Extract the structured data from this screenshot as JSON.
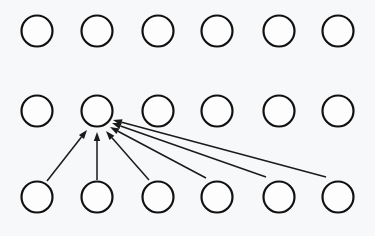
{
  "diagram": {
    "type": "node-graph",
    "canvas": {
      "width": 375,
      "height": 236
    },
    "colors": {
      "background": "#f7f8f9",
      "node_fill": "#fdfdfd",
      "node_stroke": "#111111",
      "edge_stroke": "#1a1a1a"
    },
    "node_geometry": {
      "radius": 15.5,
      "stroke_width": 2.2,
      "column_centers_x": [
        37,
        97,
        158,
        217,
        279,
        338
      ],
      "row_centers_y": [
        31,
        111,
        197
      ],
      "row_count": 3,
      "column_count": 6,
      "total_nodes": 18
    },
    "rows": [
      {
        "name": "top-row",
        "index": 0,
        "cy": 31,
        "nodes": [
          {
            "id": "t1",
            "cx": 37,
            "cy": 31
          },
          {
            "id": "t2",
            "cx": 97,
            "cy": 31
          },
          {
            "id": "t3",
            "cx": 158,
            "cy": 31
          },
          {
            "id": "t4",
            "cx": 217,
            "cy": 31
          },
          {
            "id": "t5",
            "cx": 279,
            "cy": 31
          },
          {
            "id": "t6",
            "cx": 338,
            "cy": 31
          }
        ]
      },
      {
        "name": "middle-row",
        "index": 1,
        "cy": 111,
        "nodes": [
          {
            "id": "m1",
            "cx": 37,
            "cy": 111
          },
          {
            "id": "m2",
            "cx": 97,
            "cy": 111
          },
          {
            "id": "m3",
            "cx": 158,
            "cy": 111
          },
          {
            "id": "m4",
            "cx": 217,
            "cy": 111
          },
          {
            "id": "m5",
            "cx": 279,
            "cy": 111
          },
          {
            "id": "m6",
            "cx": 338,
            "cy": 111
          }
        ]
      },
      {
        "name": "bottom-row",
        "index": 2,
        "cy": 197,
        "nodes": [
          {
            "id": "b1",
            "cx": 37,
            "cy": 197
          },
          {
            "id": "b2",
            "cx": 97,
            "cy": 197
          },
          {
            "id": "b3",
            "cx": 158,
            "cy": 197
          },
          {
            "id": "b4",
            "cx": 217,
            "cy": 197
          },
          {
            "id": "b5",
            "cx": 279,
            "cy": 197
          },
          {
            "id": "b6",
            "cx": 338,
            "cy": 197
          }
        ]
      }
    ],
    "edges": [
      {
        "id": "e1",
        "from": "b1",
        "to": "m2",
        "x1": 47,
        "y1": 181,
        "x2": 87,
        "y2": 130
      },
      {
        "id": "e2",
        "from": "b2",
        "to": "m2",
        "x1": 97,
        "y1": 180,
        "x2": 97,
        "y2": 132
      },
      {
        "id": "e3",
        "from": "b3",
        "to": "m2",
        "x1": 149,
        "y1": 180,
        "x2": 106,
        "y2": 131
      },
      {
        "id": "e4",
        "from": "b4",
        "to": "m2",
        "x1": 206,
        "y1": 178,
        "x2": 110,
        "y2": 127
      },
      {
        "id": "e5",
        "from": "b5",
        "to": "m2",
        "x1": 266,
        "y1": 177,
        "x2": 112,
        "y2": 123
      },
      {
        "id": "e6",
        "from": "b6",
        "to": "m2",
        "x1": 326,
        "y1": 177,
        "x2": 113,
        "y2": 120
      }
    ],
    "arrowhead": {
      "length": 9,
      "half_width": 3.2,
      "target_node": "m2"
    }
  }
}
